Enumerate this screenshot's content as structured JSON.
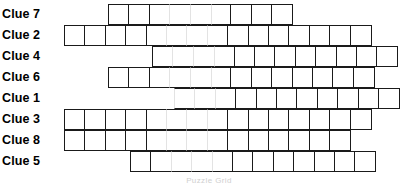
{
  "puzzle": {
    "caption": "Puzzle Grid",
    "cell_width": 22,
    "cell_height": 21,
    "border_color": "#1a1a1a",
    "highlight_color": "#e3e3e3",
    "highlight_columns": [
      5,
      6
    ],
    "rows": [
      {
        "label": "Clue 7",
        "start_col": 2,
        "cells": 9
      },
      {
        "label": "Clue 2",
        "start_col": 0,
        "cells": 15
      },
      {
        "label": "Clue 4",
        "start_col": 4,
        "cells": 12
      },
      {
        "label": "Clue 6",
        "start_col": 2,
        "cells": 13
      },
      {
        "label": "Clue 1",
        "start_col": 5,
        "cells": 11
      },
      {
        "label": "Clue 3",
        "start_col": 0,
        "cells": 15
      },
      {
        "label": "Clue 8",
        "start_col": 0,
        "cells": 14
      },
      {
        "label": "Clue 5",
        "start_col": 3,
        "cells": 12
      }
    ]
  }
}
